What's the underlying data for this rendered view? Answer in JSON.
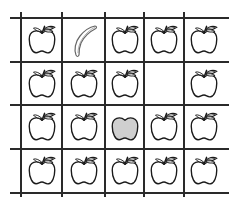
{
  "worksheet": {
    "grid": {
      "rows": 4,
      "cols": 5,
      "line_color": "#2a2a2a",
      "h_lines_y": [
        17,
        61,
        104,
        148,
        192
      ],
      "v_lines_x": [
        20,
        61,
        104,
        143,
        183
      ],
      "h_line_extent": [
        10,
        229
      ],
      "v_line_extent": [
        12,
        197
      ]
    },
    "cells": [
      [
        "apple",
        "banana",
        "apple",
        "apple",
        "apple"
      ],
      [
        "apple",
        "apple",
        "apple",
        "empty",
        "apple"
      ],
      [
        "apple",
        "apple",
        "gray-apple",
        "apple",
        "apple"
      ],
      [
        "apple",
        "apple",
        "apple",
        "apple",
        "apple"
      ]
    ],
    "colors": {
      "outline": "#1a1a1a",
      "fill": "#ffffff",
      "gray_fill": "#cfcfcf"
    }
  }
}
